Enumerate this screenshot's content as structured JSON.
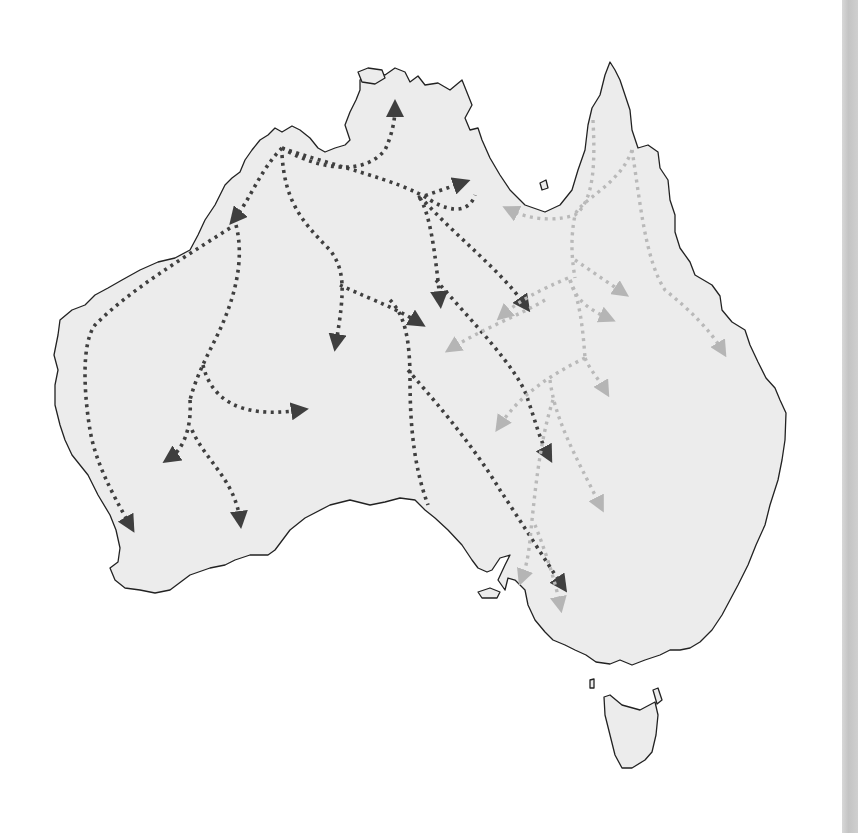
{
  "map": {
    "subject": "Australia",
    "description": "Dotted arrow routes across mainland Australia and Tasmania",
    "colors": {
      "land": "#ececec",
      "coastline": "#222222",
      "dark_routes": "#3f3f3f",
      "light_routes": "#b9b9b9",
      "background": "#ffffff"
    },
    "legend": {
      "dark_label": "Dark dotted routes (west/central)",
      "light_label": "Light dotted routes (east/Queensland)"
    },
    "regions": [
      "Mainland Australia",
      "Tasmania",
      "Kangaroo Island"
    ],
    "route_counts": {
      "dark": 16,
      "light": 13
    }
  }
}
